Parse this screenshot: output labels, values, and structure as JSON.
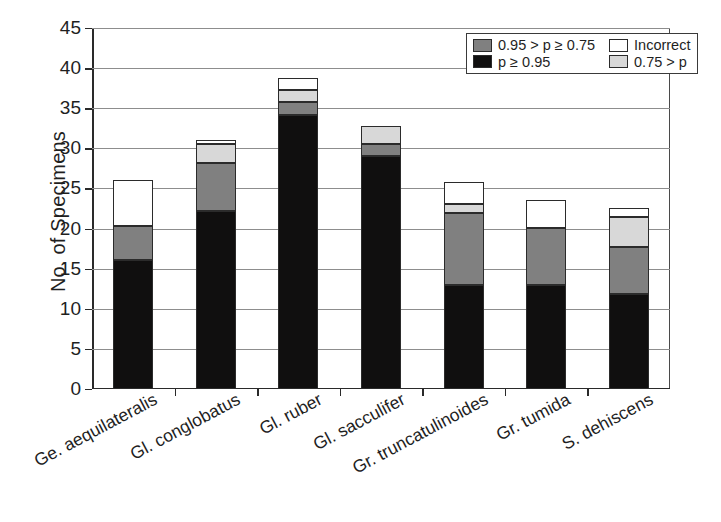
{
  "chart_data": {
    "type": "bar",
    "subtype": "stacked",
    "title": "",
    "xlabel": "",
    "ylabel": "No. of Specimens",
    "ylim": [
      0,
      45
    ],
    "ytick_step": 5,
    "yticks": [
      0,
      5,
      10,
      15,
      20,
      25,
      30,
      35,
      40,
      45
    ],
    "grid": true,
    "grid_axis": "y",
    "legend_position": "top-right",
    "categories": [
      "Ge. aequilateralis",
      "Gl. conglobatus",
      "Gl. ruber",
      "Gl. sacculifer",
      "Gr. truncatulinoides",
      "Gr. tumida",
      "S. dehiscens"
    ],
    "series": [
      {
        "name": "p ≥ 0.95",
        "color": "#100f0f",
        "values": [
          16.1,
          22.2,
          34.2,
          29.0,
          13.0,
          13.0,
          11.9
        ]
      },
      {
        "name": "0.95 > p ≥ 0.75",
        "color": "#808080",
        "values": [
          4.2,
          6.0,
          1.6,
          1.5,
          9.0,
          7.1,
          5.8
        ]
      },
      {
        "name": "0.75 > p",
        "color": "#d8d8d8",
        "values": [
          0.0,
          2.3,
          1.5,
          2.3,
          1.0,
          0.0,
          3.7
        ]
      },
      {
        "name": "Incorrect",
        "color": "#ffffff",
        "values": [
          5.7,
          0.5,
          1.5,
          0.0,
          2.8,
          3.4,
          1.2
        ]
      }
    ],
    "totals": [
      26.0,
      31.0,
      38.8,
      32.8,
      25.8,
      23.5,
      22.6
    ]
  },
  "legend": {
    "entries": [
      {
        "label": "0.95 > p ≥ 0.75",
        "color": "#808080"
      },
      {
        "label": "Incorrect",
        "color": "#ffffff"
      },
      {
        "label": "p ≥ 0.95",
        "color": "#100f0f"
      },
      {
        "label": "0.75 > p",
        "color": "#d8d8d8"
      }
    ]
  },
  "axis": {
    "y_title": "No. of Specimens"
  }
}
